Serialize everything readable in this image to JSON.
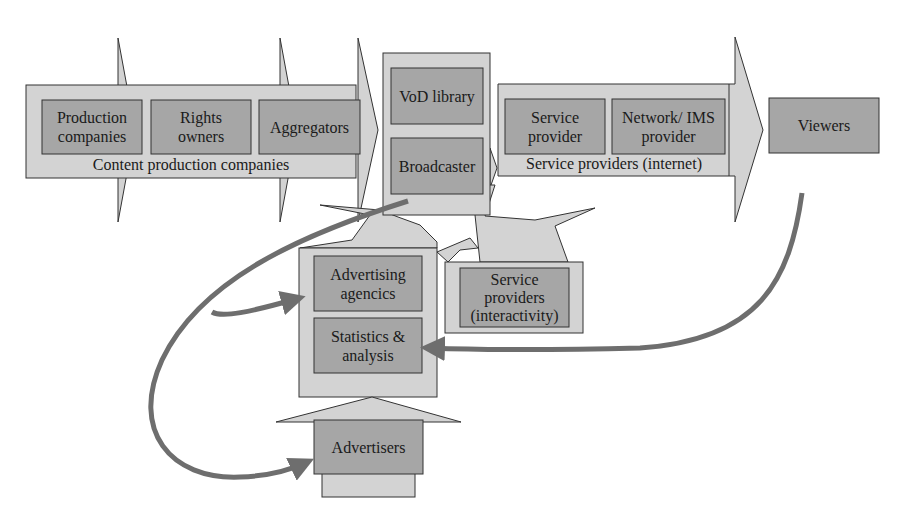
{
  "colors": {
    "outer_fill": "#d3d3d3",
    "inner_fill": "#a6a6a6",
    "stroke": "#333333",
    "flow_arrow": "#6e6e6e",
    "background": "#ffffff"
  },
  "groups": {
    "content_production": {
      "caption": "Content production companies",
      "items": [
        {
          "label": "Production\ncompanies"
        },
        {
          "label": "Rights\nowners"
        },
        {
          "label": "Aggregators"
        }
      ]
    },
    "distribution": {
      "items": [
        {
          "label": "VoD library"
        },
        {
          "label": "Broadcaster"
        }
      ]
    },
    "service_providers_internet": {
      "caption": "Service providers (internet)",
      "items": [
        {
          "label": "Service\nprovider"
        },
        {
          "label": "Network/ IMS\nprovider"
        }
      ]
    },
    "viewers": {
      "label": "Viewers"
    },
    "advertising": {
      "items": [
        {
          "label": "Advertising\nagencics"
        },
        {
          "label": "Statistics &\nanalysis"
        }
      ]
    },
    "service_providers_interactivity": {
      "label": "Service\nproviders\n(interactivity)"
    },
    "advertisers": {
      "label": "Advertisers"
    }
  },
  "flows": [
    {
      "from": "Broadcaster",
      "to": "Advertisers",
      "style": "curved-arrow"
    },
    {
      "from": "Broadcaster",
      "to": "Advertising agencics",
      "style": "curved-arrow-branch"
    },
    {
      "from": "Viewers",
      "to": "Statistics & analysis",
      "style": "curved-arrow"
    }
  ]
}
